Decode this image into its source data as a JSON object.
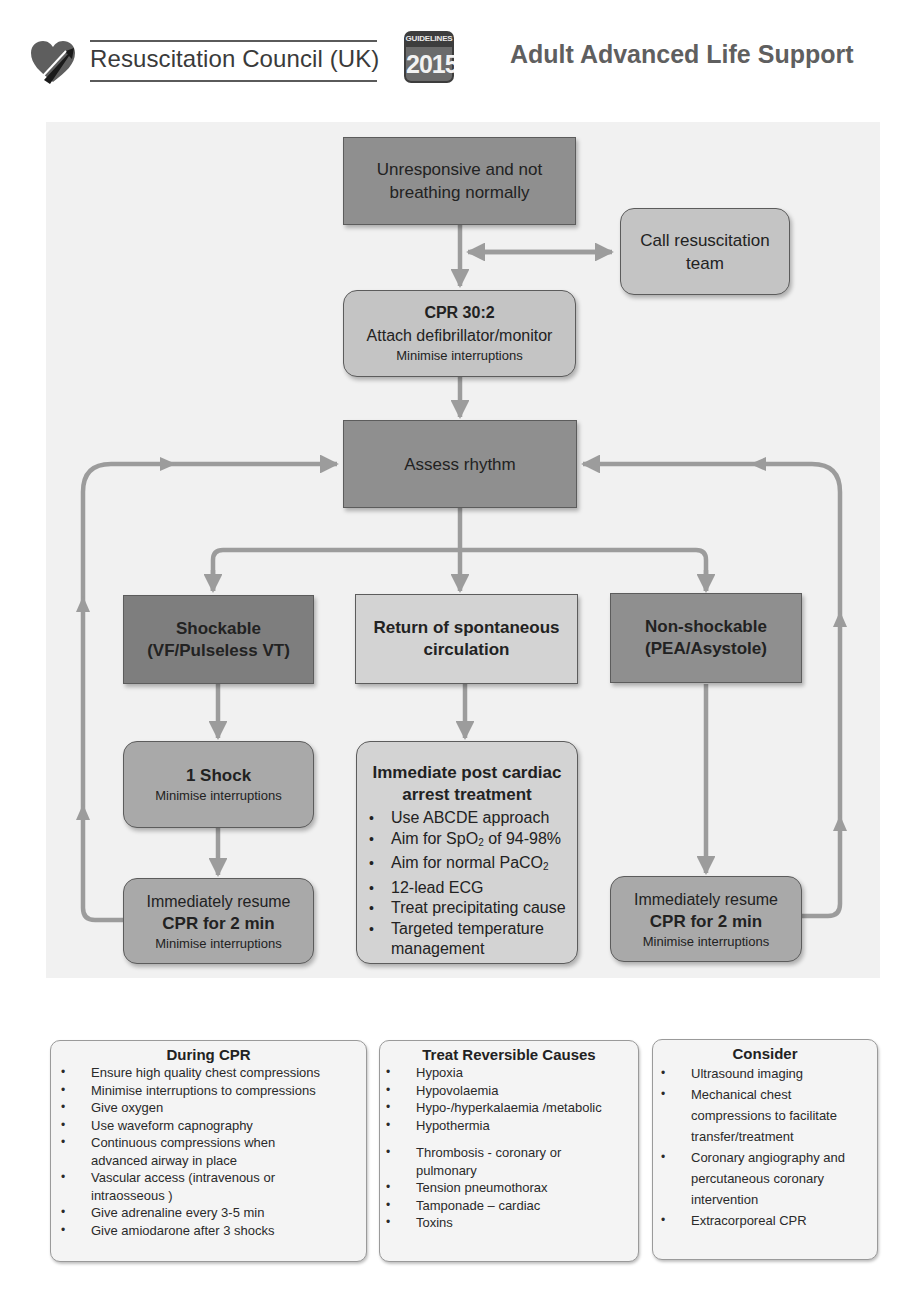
{
  "header": {
    "organization": "Resuscitation Council (UK)",
    "badge_top": "GUIDELINES",
    "badge_year": "2015",
    "title": "Adult Advanced Life Support",
    "logo_icon": "heart-logo-icon"
  },
  "flowchart": {
    "unresponsive": {
      "line1": "Unresponsive and not",
      "line2": "breathing normally"
    },
    "call_team": {
      "line1": "Call resuscitation",
      "line2": "team"
    },
    "cpr": {
      "title": "CPR 30:2",
      "line2": "Attach defibrillator/monitor",
      "line3": "Minimise interruptions"
    },
    "assess": {
      "label": "Assess rhythm"
    },
    "shockable": {
      "line1": "Shockable",
      "line2": "(VF/Pulseless VT)"
    },
    "rosc": {
      "line1": "Return of spontaneous",
      "line2": "circulation"
    },
    "nonshockable": {
      "line1": "Non-shockable",
      "line2": "(PEA/Asystole)"
    },
    "shock": {
      "title": "1 Shock",
      "line2": "Minimise interruptions"
    },
    "resume_left": {
      "line1": "Immediately resume",
      "line2": "CPR for 2 min",
      "line3": "Minimise interruptions"
    },
    "resume_right": {
      "line1": "Immediately resume",
      "line2": "CPR for 2 min",
      "line3": "Minimise interruptions"
    },
    "post_arrest": {
      "title1": "Immediate post cardiac",
      "title2": "arrest treatment",
      "items": [
        {
          "text": "Use ABCDE approach"
        },
        {
          "pre": "Aim for SpO",
          "sub": "2",
          "post": " of 94-98%"
        },
        {
          "pre": "Aim for normal PaCO",
          "sub": "2",
          "post": ""
        },
        {
          "text": "12-lead ECG"
        },
        {
          "text": "Treat precipitating cause"
        },
        {
          "text": "Targeted temperature management"
        }
      ]
    }
  },
  "during_cpr": {
    "title": "During CPR",
    "items": [
      "Ensure high quality chest compressions",
      "Minimise interruptions to compressions",
      "Give oxygen",
      "Use waveform capnography",
      "Continuous compressions when advanced airway in place",
      "Vascular access (intravenous or intraosseous )",
      "Give adrenaline every 3-5 min",
      "Give amiodarone after 3 shocks"
    ]
  },
  "reversible_causes": {
    "title": "Treat Reversible Causes",
    "items": [
      "Hypoxia",
      "Hypovolaemia",
      "Hypo-/hyperkalaemia /metabolic",
      "Hypothermia",
      "Thrombosis - coronary or pulmonary",
      "Tension pneumothorax",
      "Tamponade – cardiac",
      "Toxins"
    ]
  },
  "consider": {
    "title": "Consider",
    "items": [
      "Ultrasound imaging",
      "Mechanical chest compressions to facilitate transfer/treatment",
      "Coronary angiography and percutaneous coronary intervention",
      "Extracorporeal CPR"
    ]
  },
  "colors": {
    "arrow": "#9c9c9c",
    "panel": "#f1f1f1",
    "title": "#5f5f5f"
  }
}
